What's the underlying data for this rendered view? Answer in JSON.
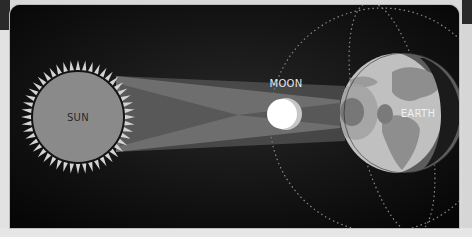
{
  "diagram": {
    "bodies": {
      "sun": {
        "label": "SUN",
        "color": "#8c8c8c",
        "ray_color": "#d0d0d0"
      },
      "moon": {
        "label": "MOON",
        "color": "#ffffff"
      },
      "earth": {
        "label": "EARTH",
        "day_color": "#bfbfbf",
        "land_color": "#8e8e8e",
        "night_color": "#5e5e5e"
      }
    },
    "shadows": {
      "penumbra_color": "#6e6e6e",
      "umbra_color": "#555555"
    },
    "colors": {
      "background": "#0c0c0c",
      "frame": "#d9d9d9",
      "orbit_dots": "#9a9a9a"
    }
  }
}
